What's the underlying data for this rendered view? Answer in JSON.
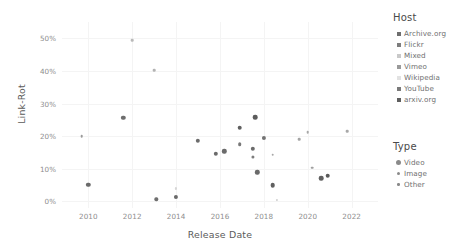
{
  "chart_data": {
    "type": "scatter",
    "title": "",
    "xlabel": "Release Date",
    "ylabel": "Link-Rot",
    "xlim": [
      2008.8,
      2023.2
    ],
    "ylim": [
      -0.02,
      0.55
    ],
    "grid": true,
    "legend_position": "right",
    "xticks": [
      "2010",
      "2012",
      "2014",
      "2016",
      "2018",
      "2020",
      "2022"
    ],
    "xtick_values": [
      2010,
      2012,
      2014,
      2016,
      2018,
      2020,
      2022
    ],
    "yticks": [
      "0%",
      "10%",
      "20%",
      "30%",
      "40%",
      "50%"
    ],
    "ytick_values": [
      0,
      10,
      20,
      30,
      40,
      50
    ],
    "series": [
      {
        "name": "Host",
        "legend_title": "Host",
        "entries": [
          {
            "label": "Archive.org",
            "color": "#6e6e6e"
          },
          {
            "label": "Flickr",
            "color": "#7d7d7d"
          },
          {
            "label": "Mixed",
            "color": "#c9c9c9"
          },
          {
            "label": "Vimeo",
            "color": "#9a9a9a"
          },
          {
            "label": "Wikipedia",
            "color": "#e2e2e2"
          },
          {
            "label": "YouTube",
            "color": "#7a7a7a"
          },
          {
            "label": "arxiv.org",
            "color": "#5f5f5f"
          }
        ]
      },
      {
        "name": "Type",
        "legend_title": "Type",
        "entries": [
          {
            "label": "Video",
            "size": 5.0
          },
          {
            "label": "Image",
            "size": 3.6
          },
          {
            "label": "Other",
            "size": 2.4
          }
        ]
      }
    ],
    "points": [
      {
        "x": 2009.7,
        "y": 20.0,
        "type": "Other",
        "host": "Mixed",
        "size": 2.6,
        "color": "#9b9b9b"
      },
      {
        "x": 2010.0,
        "y": 5.2,
        "type": "Video",
        "host": "YouTube",
        "size": 4.4,
        "color": "#6a6a6a"
      },
      {
        "x": 2011.6,
        "y": 25.7,
        "type": "Video",
        "host": "YouTube",
        "size": 4.4,
        "color": "#6e6e6e"
      },
      {
        "x": 2012.0,
        "y": 49.5,
        "type": "Other",
        "host": "Wikipedia",
        "size": 2.6,
        "color": "#b9b9b9"
      },
      {
        "x": 2013.0,
        "y": 40.2,
        "type": "Other",
        "host": "Mixed",
        "size": 2.6,
        "color": "#b3b3b3"
      },
      {
        "x": 2013.1,
        "y": 0.7,
        "type": "Image",
        "host": "Flickr",
        "size": 3.4,
        "color": "#6f6f6f"
      },
      {
        "x": 2014.0,
        "y": 1.5,
        "type": "Video",
        "host": "YouTube",
        "size": 4.2,
        "color": "#6a6a6a"
      },
      {
        "x": 2014.0,
        "y": 4.0,
        "type": "Other",
        "host": "Wikipedia",
        "size": 2.2,
        "color": "#d6d6d6"
      },
      {
        "x": 2015.0,
        "y": 18.6,
        "type": "Video",
        "host": "YouTube",
        "size": 4.4,
        "color": "#6c6c6c"
      },
      {
        "x": 2015.8,
        "y": 14.7,
        "type": "Video",
        "host": "YouTube",
        "size": 4.4,
        "color": "#6b6b6b"
      },
      {
        "x": 2016.2,
        "y": 15.4,
        "type": "Video",
        "host": "YouTube",
        "size": 4.4,
        "color": "#6b6b6b"
      },
      {
        "x": 2016.9,
        "y": 22.6,
        "type": "Video",
        "host": "Archive.org",
        "size": 4.6,
        "color": "#5f5f5f"
      },
      {
        "x": 2016.9,
        "y": 17.5,
        "type": "Image",
        "host": "Flickr",
        "size": 3.6,
        "color": "#787878"
      },
      {
        "x": 2017.5,
        "y": 16.2,
        "type": "Video",
        "host": "YouTube",
        "size": 4.4,
        "color": "#6b6b6b"
      },
      {
        "x": 2017.5,
        "y": 13.6,
        "type": "Image",
        "host": "Flickr",
        "size": 3.2,
        "color": "#7d7d7d"
      },
      {
        "x": 2017.6,
        "y": 25.8,
        "type": "Video",
        "host": "Archive.org",
        "size": 4.6,
        "color": "#5c5c5c"
      },
      {
        "x": 2017.7,
        "y": 9.0,
        "type": "Video",
        "host": "YouTube",
        "size": 4.4,
        "color": "#6a6a6a"
      },
      {
        "x": 2018.0,
        "y": 19.6,
        "type": "Video",
        "host": "Vimeo",
        "size": 4.2,
        "color": "#737373"
      },
      {
        "x": 2018.4,
        "y": 14.3,
        "type": "Other",
        "host": "Mixed",
        "size": 2.6,
        "color": "#a8a8a8"
      },
      {
        "x": 2018.4,
        "y": 5.0,
        "type": "Video",
        "host": "YouTube",
        "size": 4.6,
        "color": "#606060"
      },
      {
        "x": 2018.6,
        "y": 0.6,
        "type": "Other",
        "host": "Wikipedia",
        "size": 2.2,
        "color": "#d0d0d0"
      },
      {
        "x": 2019.6,
        "y": 19.0,
        "type": "Other",
        "host": "Mixed",
        "size": 2.6,
        "color": "#a5a5a5"
      },
      {
        "x": 2020.0,
        "y": 21.3,
        "type": "Other",
        "host": "Mixed",
        "size": 2.6,
        "color": "#a8a8a8"
      },
      {
        "x": 2020.2,
        "y": 10.4,
        "type": "Other",
        "host": "Mixed",
        "size": 2.6,
        "color": "#a0a0a0"
      },
      {
        "x": 2020.6,
        "y": 7.1,
        "type": "Video",
        "host": "YouTube",
        "size": 4.6,
        "color": "#606060"
      },
      {
        "x": 2020.9,
        "y": 7.9,
        "type": "Video",
        "host": "arxiv.org",
        "size": 4.6,
        "color": "#5a5a5a"
      },
      {
        "x": 2021.8,
        "y": 21.6,
        "type": "Other",
        "host": "Mixed",
        "size": 2.6,
        "color": "#a8a8a8"
      }
    ]
  }
}
